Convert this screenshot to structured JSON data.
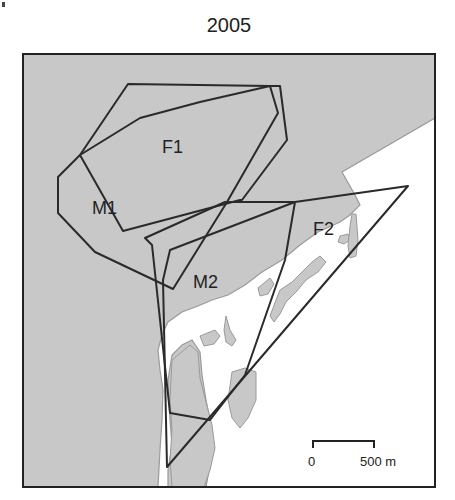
{
  "map": {
    "title": "2005",
    "colors": {
      "land": "#c8c8c8",
      "water": "#ffffff",
      "coast_outline": "#9a9a9a",
      "range_line": "#2a2a2a",
      "frame": "#222222"
    },
    "home_ranges": [
      {
        "id": "F1",
        "label": "F1"
      },
      {
        "id": "M1",
        "label": "M1"
      },
      {
        "id": "M2",
        "label": "M2"
      },
      {
        "id": "F2",
        "label": "F2"
      }
    ],
    "scale_bar": {
      "start_label": "0",
      "end_label": "500 m"
    }
  }
}
